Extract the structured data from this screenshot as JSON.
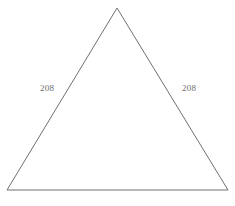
{
  "figure": {
    "name": "isosceles-triangle",
    "background_color": "#ffffff",
    "stroke_color": "#707070",
    "stroke_width": 1,
    "canvas": {
      "width": 235,
      "height": 206
    },
    "vertices": {
      "apex": {
        "x": 117,
        "y": 8
      },
      "bottom_left": {
        "x": 7,
        "y": 190
      },
      "bottom_right": {
        "x": 228,
        "y": 190
      }
    },
    "labels": {
      "left_side": {
        "text": "208",
        "color": "#6e6e6e",
        "x": 40,
        "y": 83
      },
      "right_side": {
        "text": "208",
        "color": "#6e6e6e",
        "x": 182,
        "y": 83
      }
    }
  }
}
